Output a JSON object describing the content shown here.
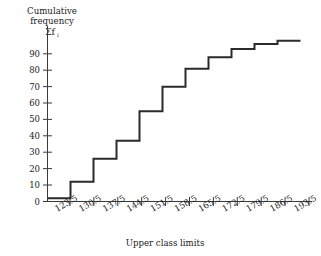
{
  "chart_data": {
    "type": "line",
    "subtype": "step-ogive",
    "title": "",
    "ylabel_lines": [
      "Cumulative",
      "frequency"
    ],
    "ylabel_symbol": "Σf",
    "ylabel_symbol_sub": "i",
    "xlabel": "Upper class limits",
    "categories": [
      "123.5",
      "130.5",
      "137.5",
      "144.5",
      "151.5",
      "158.5",
      "165.5",
      "172.5",
      "179.5",
      "186.5",
      "193.5"
    ],
    "x": [
      123.5,
      130.5,
      137.5,
      144.5,
      151.5,
      158.5,
      165.5,
      172.5,
      179.5,
      186.5,
      193.5
    ],
    "values": [
      2,
      12,
      26,
      37,
      55,
      70,
      81,
      88,
      93,
      96,
      98
    ],
    "series": [
      {
        "name": "Cumulative frequency",
        "values": [
          2,
          12,
          26,
          37,
          55,
          70,
          81,
          88,
          93,
          96,
          98
        ]
      }
    ],
    "start_value": 2,
    "yticks": [
      0,
      10,
      20,
      30,
      40,
      50,
      60,
      70,
      80,
      90
    ],
    "ytick_labels": [
      "0",
      "10",
      "20",
      "30",
      "40",
      "50",
      "60",
      "70",
      "80",
      "90"
    ],
    "ylim": [
      0,
      100
    ],
    "xlim": [
      116.5,
      197.0
    ],
    "grid": false,
    "legend": "none",
    "line_color": "#2b2b2b",
    "axis_color": "#3a3a3a",
    "background": "#ffffff",
    "xtick_label_rotation_deg": -30
  }
}
